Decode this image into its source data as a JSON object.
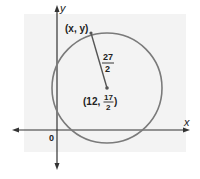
{
  "diagram": {
    "axes": {
      "x_label": "x",
      "y_label": "y",
      "origin_label": "0"
    },
    "circle": {
      "stroke_color": "#7a7a7a",
      "center_label": {
        "open": "(12, ",
        "num": "17",
        "den": "2",
        "close": ")"
      },
      "point_label": "(x, y)",
      "radius_label": {
        "num": "27",
        "den": "2"
      }
    },
    "colors": {
      "panel": "#f3f3f3",
      "axis": "#333333"
    }
  }
}
